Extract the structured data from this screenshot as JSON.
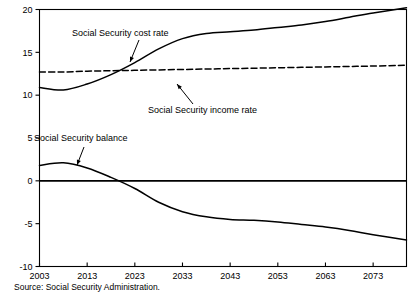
{
  "chart_data": {
    "type": "line",
    "title": "",
    "subtitle": "",
    "xlabel": "",
    "ylabel": "",
    "xlim": [
      2003,
      2080
    ],
    "ylim": [
      -10,
      20
    ],
    "grid": false,
    "legend_position": "none (inline annotations with arrows)",
    "units": "percent of taxable payroll",
    "x_ticks": [
      2003,
      2013,
      2023,
      2033,
      2043,
      2053,
      2063,
      2073
    ],
    "x_tick_labels": [
      "2003",
      "2013",
      "2023",
      "2033",
      "2043",
      "2053",
      "2063",
      "2073"
    ],
    "y_ticks": [
      -10,
      -5,
      0,
      5,
      10,
      15,
      20
    ],
    "y_tick_labels": [
      "-10",
      "-5",
      "0",
      "5",
      "10",
      "15",
      "20"
    ],
    "x": [
      2003,
      2008,
      2013,
      2018,
      2023,
      2028,
      2033,
      2038,
      2043,
      2048,
      2053,
      2058,
      2063,
      2068,
      2073,
      2080
    ],
    "series": [
      {
        "name": "Social Security cost rate",
        "style": "solid",
        "values": [
          10.9,
          10.6,
          11.3,
          12.4,
          13.8,
          15.4,
          16.6,
          17.2,
          17.4,
          17.6,
          17.9,
          18.2,
          18.6,
          19.1,
          19.6,
          20.2
        ]
      },
      {
        "name": "Social Security income rate",
        "style": "dashed",
        "values": [
          12.7,
          12.7,
          12.8,
          12.85,
          12.9,
          12.95,
          13.0,
          13.05,
          13.1,
          13.15,
          13.2,
          13.25,
          13.3,
          13.35,
          13.4,
          13.5
        ]
      },
      {
        "name": "Social Security balance",
        "style": "solid",
        "values": [
          1.8,
          2.1,
          1.5,
          0.4,
          -0.9,
          -2.5,
          -3.6,
          -4.2,
          -4.5,
          -4.6,
          -4.8,
          -5.1,
          -5.4,
          -5.8,
          -6.3,
          -6.9
        ]
      }
    ],
    "annotations": [
      {
        "text": "Social Security cost rate",
        "label_x": 72,
        "label_y": 36,
        "arrow_from_x": 139,
        "arrow_from_y": 40,
        "arrow_to_x": 130,
        "arrow_to_y": 62
      },
      {
        "text": "Social Security income rate",
        "label_x": 148,
        "label_y": 113,
        "arrow_from_x": 193,
        "arrow_from_y": 104,
        "arrow_to_x": 177,
        "arrow_to_y": 84
      },
      {
        "text": "Social Security balance",
        "label_x": 34,
        "label_y": 141,
        "arrow_from_x": 84,
        "arrow_from_y": 147,
        "arrow_to_x": 77,
        "arrow_to_y": 165
      }
    ],
    "zero_line": 0
  },
  "footer": {
    "source": "Source: Social Security Administration."
  },
  "colors": {
    "line": "#000000",
    "background": "#ffffff",
    "text": "#000000"
  }
}
